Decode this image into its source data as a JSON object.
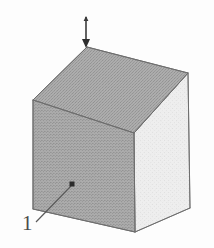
{
  "figure": {
    "type": "technical-line-drawing",
    "projection": "axonometric",
    "background_color": "#fdfdfd",
    "canvas": {
      "width": 214,
      "height": 248
    }
  },
  "callouts": [
    {
      "id": "callout-1",
      "label": "1",
      "label_x": 22,
      "label_y": 213,
      "marker": {
        "shape": "square",
        "x": 72,
        "y": 184,
        "size": 5,
        "color": "#2b2b2b"
      },
      "leader_line": {
        "x1": 36,
        "y1": 222,
        "x2": 71,
        "y2": 186,
        "color": "#5a5a5a"
      }
    }
  ],
  "arrow": {
    "id": "top-arrow",
    "orientation": "vertical-down",
    "x": 86,
    "y_start": 17,
    "y_end": 47,
    "head_at": "bottom",
    "color": "#3a3a3a",
    "points_to_vertex": "top"
  },
  "cube": {
    "vertices": {
      "top": {
        "x": 87,
        "y": 47
      },
      "left": {
        "x": 33,
        "y": 100
      },
      "right": {
        "x": 188,
        "y": 73
      },
      "center": {
        "x": 134,
        "y": 133
      },
      "bottom_left": {
        "x": 33,
        "y": 209
      },
      "bottom_center": {
        "x": 135,
        "y": 232
      },
      "bottom_right": {
        "x": 190,
        "y": 208
      }
    },
    "faces": [
      {
        "name": "top-face",
        "fill": "#a8a8a8",
        "vertices": "top,left,center,right"
      },
      {
        "name": "front-left-face",
        "fill": "#a5a5a5",
        "vertices": "left,center,bottom_center,bottom_left"
      },
      {
        "name": "right-face",
        "fill": "#efefef",
        "vertices": "center,right,bottom_right,bottom_center"
      }
    ],
    "edge_color": "#707070",
    "edge_width": 1
  },
  "colors": {
    "top_face": "#a8a8a8",
    "front_face": "#a5a5a5",
    "right_face": "#efefef",
    "edge": "#707070",
    "label": "#4a4a4a",
    "leader": "#5a5a5a",
    "marker": "#2b2b2b",
    "arrow": "#3a3a3a"
  }
}
